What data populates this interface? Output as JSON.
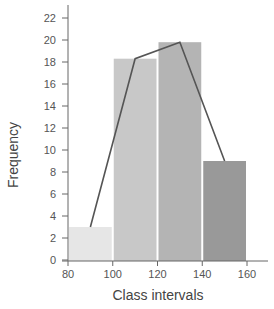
{
  "chart_data": {
    "type": "bar",
    "subtype": "histogram_with_frequency_polygon",
    "title": "",
    "xlabel": "Class intervals",
    "ylabel": "Frequency",
    "xlim": [
      80,
      160
    ],
    "ylim": [
      0,
      22
    ],
    "x_ticks": [
      80,
      100,
      120,
      140,
      160
    ],
    "y_ticks": [
      0,
      2,
      4,
      6,
      8,
      10,
      12,
      14,
      16,
      18,
      20,
      22
    ],
    "categories": [
      "80-100",
      "100-120",
      "120-140",
      "140-160"
    ],
    "bins": [
      [
        80,
        100
      ],
      [
        100,
        120
      ],
      [
        120,
        140
      ],
      [
        140,
        160
      ]
    ],
    "values": [
      3,
      18.3,
      19.8,
      9
    ],
    "bar_colors": [
      "#e6e6e6",
      "#c8c8c8",
      "#b4b4b4",
      "#999999"
    ],
    "polygon": {
      "x": [
        90,
        110,
        130,
        150
      ],
      "y": [
        3,
        18.3,
        19.8,
        9
      ],
      "color": "#555555"
    },
    "grid": false,
    "legend": null
  }
}
